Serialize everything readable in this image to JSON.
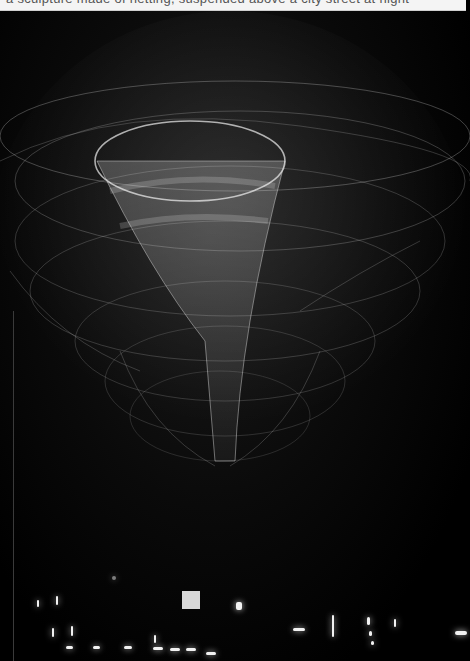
{
  "caption_strip": {
    "text": "a sculpture made of netting, suspended above a city street at night"
  },
  "photo": {
    "subject": "suspended net sculpture at night",
    "colors": {
      "background": "#000000",
      "net": "#d9d9d9",
      "city_lights": "#f2f2f2"
    }
  }
}
